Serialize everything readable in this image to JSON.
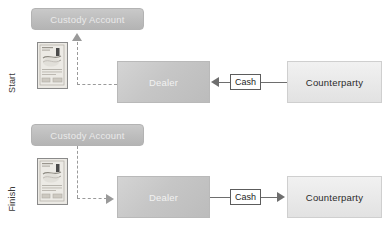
{
  "diagram": {
    "title_rows": [
      {
        "id": "start",
        "label": "Start"
      },
      {
        "id": "finish",
        "label": "Finish"
      }
    ],
    "colors": {
      "custody_fill": "#bdbdbd",
      "custody_text": "#eaeaea",
      "dealer_fill": "#c6c6c6",
      "dealer_text": "#f2f2f2",
      "counterparty_fill": "#e8e8e8",
      "counterparty_text": "#2b2b2b",
      "solid_connector": "#6e6e6e",
      "dashed_connector": "#9a9a9a",
      "cash_border": "#5c5c5c",
      "background": "#ffffff"
    },
    "rows": {
      "start": {
        "row_label": "Start",
        "custody_account": "Custody Account",
        "certificate_alt": "security-certificate",
        "dealer": "Dealer",
        "cash": "Cash",
        "counterparty": "Counterparty",
        "flow_solid": "Counterparty pays Cash to Dealer",
        "flow_dashed": "Security moves from Dealer up to Custody Account"
      },
      "finish": {
        "row_label": "Finish",
        "custody_account": "Custody Account",
        "certificate_alt": "security-certificate",
        "dealer": "Dealer",
        "cash": "Cash",
        "counterparty": "Counterparty",
        "flow_solid": "Dealer pays Cash to Counterparty",
        "flow_dashed": "Security moves from Custody Account across to Dealer"
      }
    }
  }
}
